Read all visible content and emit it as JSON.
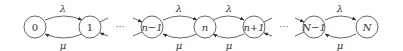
{
  "diagram": {
    "type": "birth-death-chain",
    "nodes": [
      {
        "id": "0",
        "label": "0"
      },
      {
        "id": "1",
        "label": "1"
      },
      {
        "id": "n-1",
        "label": "n−1"
      },
      {
        "id": "n",
        "label": "n"
      },
      {
        "id": "n+1",
        "label": "n+1"
      },
      {
        "id": "N-1",
        "label": "N−1"
      },
      {
        "id": "N",
        "label": "N"
      }
    ],
    "ellipsis": [
      "···",
      "···"
    ],
    "rates": {
      "forward": "λ",
      "backward": "μ"
    },
    "edges": [
      {
        "from": "0",
        "to": "1",
        "forward_label": "λ",
        "backward_label": "μ"
      },
      {
        "from": "n-1",
        "to": "n",
        "forward_label": "λ",
        "backward_label": "μ"
      },
      {
        "from": "n",
        "to": "n+1",
        "forward_label": "λ",
        "backward_label": "μ"
      },
      {
        "from": "N-1",
        "to": "N",
        "forward_label": "λ",
        "backward_label": "μ"
      }
    ],
    "colors": {
      "stroke": "#555555",
      "text": "#333333",
      "background": "#ffffff"
    }
  }
}
